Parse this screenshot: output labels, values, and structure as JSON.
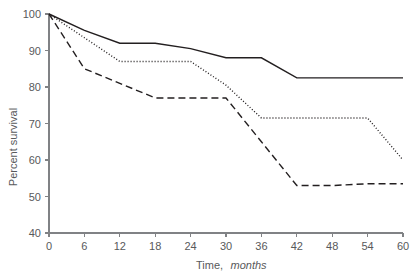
{
  "chart_data": {
    "type": "line",
    "title": "",
    "xlabel": "Time, months",
    "xlabel_plain": "Time,",
    "xlabel_italic": "months",
    "ylabel": "Percent survival",
    "xlim": [
      0,
      60
    ],
    "ylim": [
      40,
      100
    ],
    "xticks": [
      0,
      6,
      12,
      18,
      24,
      30,
      36,
      42,
      48,
      54,
      60
    ],
    "yticks": [
      40,
      50,
      60,
      70,
      80,
      90,
      100
    ],
    "xtick_labels": [
      "0",
      "6",
      "12",
      "18",
      "24",
      "30",
      "36",
      "42",
      "48",
      "54",
      "60"
    ],
    "ytick_labels": [
      "40",
      "50",
      "60",
      "70",
      "80",
      "90",
      "100"
    ],
    "grid": false,
    "legend": "none",
    "x": [
      0,
      6,
      12,
      18,
      24,
      30,
      36,
      42,
      48,
      54,
      60
    ],
    "series": [
      {
        "name": "solid-curve",
        "style": "solid",
        "color": "#231f20",
        "values": [
          100,
          95.5,
          92,
          92,
          90.5,
          88,
          88,
          82.5,
          82.5,
          82.5,
          82.5
        ]
      },
      {
        "name": "dotted-curve",
        "style": "dotted",
        "color": "#231f20",
        "values": [
          100,
          93.5,
          87,
          87,
          87,
          80.5,
          71.5,
          71.5,
          71.5,
          71.5,
          60
        ]
      },
      {
        "name": "dashed-curve",
        "style": "dashed",
        "color": "#231f20",
        "values": [
          100,
          85,
          81,
          77,
          77,
          77,
          65,
          53,
          53,
          53.5,
          53.5
        ]
      }
    ]
  },
  "axes": {
    "y_axis_label": "Percent survival",
    "x_axis_label_plain": "Time,",
    "x_axis_label_italic": "months"
  }
}
